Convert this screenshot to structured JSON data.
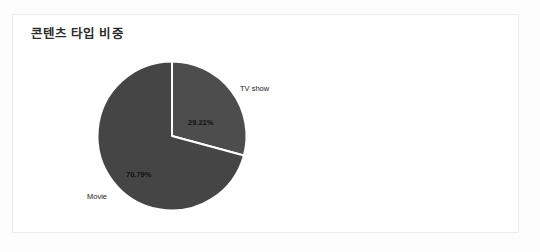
{
  "card": {
    "title": "콘텐츠 타입 비중"
  },
  "chart_data": {
    "type": "pie",
    "title": "콘텐츠 타입 비중",
    "categories": [
      "TV show",
      "Movie"
    ],
    "values": [
      29.21,
      70.79
    ],
    "value_labels": [
      "29.21%",
      "70.79%"
    ],
    "unit": "%",
    "legend": "none",
    "start_angle_deg": 0,
    "direction": "clockwise",
    "slices": [
      {
        "name": "TV show",
        "label": "TV show",
        "value": 29.21,
        "value_label": "29.21%",
        "color": "#4d4d4d",
        "angle_deg": 105.16
      },
      {
        "name": "Movie",
        "label": "Movie",
        "value": 70.79,
        "value_label": "70.79%",
        "color": "#454545",
        "angle_deg": 254.84
      }
    ],
    "separator_color": "#ffffff",
    "grid": false
  },
  "colors": {
    "page_background": "#fdfdfd",
    "card_background": "#ffffff",
    "card_border": "#ececec",
    "title_text": "#2b2b2b",
    "label_text": "#1d1d1d",
    "slice_tv_show": "#4d4d4d",
    "slice_movie": "#454545",
    "separator": "#ffffff"
  }
}
